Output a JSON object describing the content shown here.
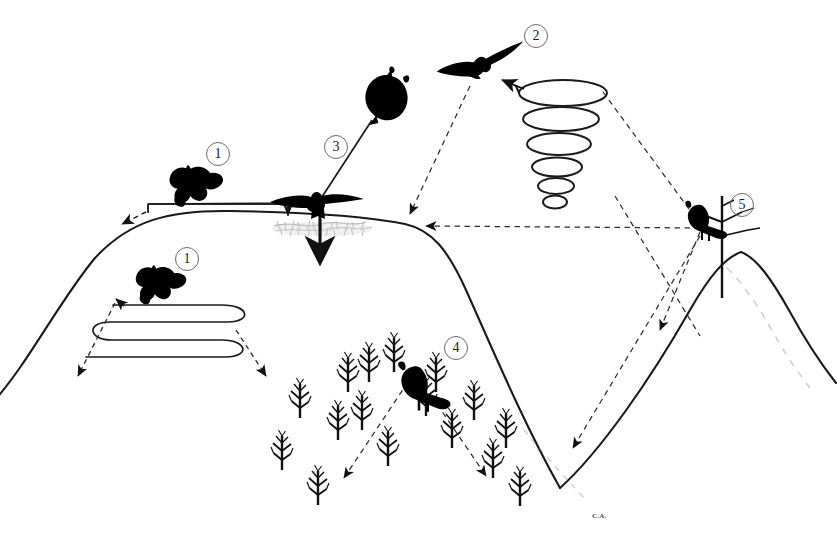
{
  "figure": {
    "type": "schematic-diagram",
    "background_color": "#ffffff",
    "line_color": "#1a1a1a",
    "silhouette_color": "#000000",
    "dashed_color": "#3a3a3a",
    "ground_shade_color": "#9a9a9a"
  },
  "annotations": {
    "markers": [
      {
        "id": "1a",
        "label": "1",
        "x": 206,
        "y": 142,
        "describes": "quartering flight over ridge crest"
      },
      {
        "id": "1b",
        "label": "1",
        "x": 175,
        "y": 247,
        "describes": "serpentine contour-hugging search flight"
      },
      {
        "id": "2",
        "label": "2",
        "x": 524,
        "y": 24,
        "describes": "soaring ascent in thermal spiral"
      },
      {
        "id": "3",
        "label": "3",
        "x": 324,
        "y": 135,
        "describes": "stoop and strike to ground"
      },
      {
        "id": "4",
        "label": "4",
        "x": 444,
        "y": 336,
        "describes": "perch hunting from tree in woodland"
      },
      {
        "id": "5",
        "label": "5",
        "x": 730,
        "y": 193,
        "describes": "perch hunting from snag on hilltop"
      }
    ],
    "text_labels": [
      {
        "id": "ca",
        "text": "C.A.",
        "x": 592,
        "y": 515
      }
    ]
  },
  "terrain": {
    "left_hill": "broad rounded ridge rising from left edge to a flat crest then falling to a valley",
    "right_hill": "steep peak at right with slope falling left into the valley and right off the frame",
    "valley_floor_x": 560,
    "valley_floor_y": 488
  },
  "birds": [
    {
      "id": "bird-quartering-upper",
      "pose": "flapping-quartering",
      "x": 190,
      "y": 183,
      "scale": 1.0
    },
    {
      "id": "bird-quartering-lower",
      "pose": "flapping-quartering",
      "x": 155,
      "y": 282,
      "scale": 0.95
    },
    {
      "id": "bird-stooping",
      "pose": "stoop-dive-tucked",
      "x": 387,
      "y": 100,
      "scale": 1.0
    },
    {
      "id": "bird-landing",
      "pose": "wings-spread-landing",
      "x": 315,
      "y": 203,
      "scale": 1.0
    },
    {
      "id": "bird-soaring",
      "pose": "soaring-glide",
      "x": 481,
      "y": 71,
      "scale": 1.0
    },
    {
      "id": "bird-perched-tree",
      "pose": "perched",
      "x": 428,
      "y": 392,
      "scale": 1.0
    },
    {
      "id": "bird-perched-snag",
      "pose": "perched",
      "x": 708,
      "y": 230,
      "scale": 0.85
    }
  ],
  "flight_paths": [
    {
      "id": "path-crest-bracket",
      "style": "solid",
      "describes": "low bracket-shaped pass along the ridge crest with arrowheads at both ends"
    },
    {
      "id": "path-serpentine",
      "style": "solid",
      "describes": "three-lobed serpentine sweep on the lee slope with an up-left arrow"
    },
    {
      "id": "path-thermal-spiral",
      "style": "solid",
      "describes": "six-turn conical helix narrowing downward, arrow at top-left exit"
    },
    {
      "id": "path-stoop",
      "style": "solid",
      "describes": "straight stoop line from the tucked bird down to the landing bird"
    },
    {
      "id": "path-strike",
      "style": "solid-bold-arrow",
      "describes": "bold vertical arrow from landing bird into the ground patch"
    },
    {
      "id": "path-dashed-serpentine-left",
      "style": "dashed",
      "describes": "dashed link from serpentine path down-left to arrowhead"
    },
    {
      "id": "path-dashed-serpentine-right",
      "style": "dashed",
      "describes": "dashed link from serpentine path down-right to arrowhead"
    },
    {
      "id": "path-dashed-crest-left",
      "style": "dashed",
      "describes": "dashed link from the crest bracket to the left shoulder of the ridge"
    },
    {
      "id": "path-dashed-soar-to-crest",
      "style": "dashed",
      "describes": "dashed line from soaring bird down-left to the ridge shoulder"
    },
    {
      "id": "path-dashed-spiral-to-snag",
      "style": "dashed",
      "describes": "dashed line from the top of the thermal spiral down-right toward the hilltop snag"
    },
    {
      "id": "path-dashed-snag-to-crest",
      "style": "dashed",
      "describes": "long horizontal dashed line from the hilltop snag left to the ridge shoulder"
    },
    {
      "id": "path-dashed-spiral-to-slope",
      "style": "dashed",
      "describes": "dashed line crossing down-right to an arrowhead on the right hill slope"
    },
    {
      "id": "path-dashed-snag-to-valley",
      "style": "dashed",
      "describes": "dashed line from the hilltop snag down-left to an arrowhead in the valley"
    },
    {
      "id": "path-dashed-perch-left",
      "style": "dashed",
      "describes": "dashed attack line from the perched bird down-left into the trees"
    },
    {
      "id": "path-dashed-perch-right",
      "style": "dashed",
      "describes": "dashed attack line from the perched bird down-right into the trees"
    }
  ],
  "vegetation": {
    "ground_patch": "stippled grey vegetation band beneath the strike point on the ridge crest",
    "tree_count": 16,
    "tree_type": "bare deciduous saplings forming a V-shaped woodland in the valley"
  }
}
